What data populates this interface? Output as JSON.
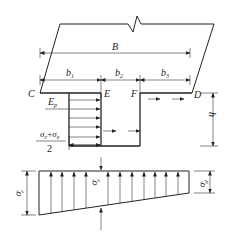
{
  "diagram": {
    "type": "foundation-pressure-diagram",
    "labels": {
      "B": "B",
      "b1": "b",
      "b1_sub": "1",
      "b2": "b",
      "b2_sub": "2",
      "b3": "b",
      "b3_sub": "3",
      "C": "C",
      "D": "D",
      "E": "E",
      "F": "F",
      "h": "h",
      "Ep": "E",
      "Ep_sub": "p",
      "frac_num_a": "σ",
      "frac_num_a_sub": "c",
      "frac_plus": "+",
      "frac_num_b": "σ",
      "frac_num_b_sub": "e",
      "frac_den": "2",
      "sigma_c": "σ",
      "sigma_c_sub": "c",
      "sigma_e": "σ",
      "sigma_e_sub": "e",
      "sigma_d": "σ",
      "sigma_d_sub": "d"
    },
    "line_color": "#222222",
    "background": "#ffffff"
  }
}
